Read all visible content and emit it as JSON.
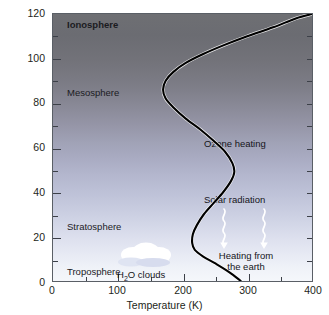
{
  "chart_data": {
    "type": "line",
    "title": "",
    "xlabel": "Temperature (K)",
    "ylabel": "Altitude (km)",
    "xlim": [
      0,
      400
    ],
    "ylim": [
      0,
      120
    ],
    "xticks": [
      0,
      100,
      200,
      300,
      400
    ],
    "yticks": [
      0,
      20,
      40,
      60,
      80,
      100,
      120
    ],
    "xtick_labels": [
      "0",
      "100",
      "200",
      "300",
      "400"
    ],
    "ytick_labels": [
      "0",
      "20",
      "40",
      "60",
      "80",
      "100",
      "120"
    ],
    "x_minor_step": 50,
    "y_minor_step": 10,
    "grid": false,
    "legend": false,
    "series": [
      {
        "name": "Atmospheric temperature profile",
        "color": "#000000",
        "x_is_temperature": true,
        "points": [
          {
            "temperature_K": 290,
            "altitude_km": 0
          },
          {
            "temperature_K": 272,
            "altitude_km": 4
          },
          {
            "temperature_K": 250,
            "altitude_km": 8
          },
          {
            "temperature_K": 232,
            "altitude_km": 11
          },
          {
            "temperature_K": 219,
            "altitude_km": 14
          },
          {
            "temperature_K": 215,
            "altitude_km": 17
          },
          {
            "temperature_K": 216,
            "altitude_km": 21
          },
          {
            "temperature_K": 222,
            "altitude_km": 25
          },
          {
            "temperature_K": 233,
            "altitude_km": 30
          },
          {
            "temperature_K": 248,
            "altitude_km": 35
          },
          {
            "temperature_K": 263,
            "altitude_km": 40
          },
          {
            "temperature_K": 275,
            "altitude_km": 45
          },
          {
            "temperature_K": 280,
            "altitude_km": 49
          },
          {
            "temperature_K": 277,
            "altitude_km": 53
          },
          {
            "temperature_K": 266,
            "altitude_km": 58
          },
          {
            "temperature_K": 248,
            "altitude_km": 63
          },
          {
            "temperature_K": 228,
            "altitude_km": 68
          },
          {
            "temperature_K": 205,
            "altitude_km": 73
          },
          {
            "temperature_K": 186,
            "altitude_km": 78
          },
          {
            "temperature_K": 174,
            "altitude_km": 82
          },
          {
            "temperature_K": 170,
            "altitude_km": 86
          },
          {
            "temperature_K": 174,
            "altitude_km": 90
          },
          {
            "temperature_K": 186,
            "altitude_km": 94
          },
          {
            "temperature_K": 205,
            "altitude_km": 98
          },
          {
            "temperature_K": 232,
            "altitude_km": 102
          },
          {
            "temperature_K": 264,
            "altitude_km": 106
          },
          {
            "temperature_K": 300,
            "altitude_km": 110
          },
          {
            "temperature_K": 340,
            "altitude_km": 114
          },
          {
            "temperature_K": 375,
            "altitude_km": 118
          },
          {
            "temperature_K": 400,
            "altitude_km": 120
          }
        ],
        "key_features": [
          {
            "name": "surface",
            "temperature_K": 290,
            "altitude_km": 0
          },
          {
            "name": "tropopause",
            "temperature_K": 215,
            "altitude_km": 16
          },
          {
            "name": "stratopause",
            "temperature_K": 280,
            "altitude_km": 49
          },
          {
            "name": "mesopause",
            "temperature_K": 170,
            "altitude_km": 86
          },
          {
            "name": "thermosphere-top",
            "temperature_K": 400,
            "altitude_km": 120
          }
        ]
      }
    ],
    "regions": [
      {
        "label": "Ionosphere",
        "altitude_km_center": 116,
        "bold": true
      },
      {
        "label": "Mesosphere",
        "altitude_km_center": 87,
        "bold": false
      },
      {
        "label": "Stratosphere",
        "altitude_km_center": 27,
        "bold": false
      },
      {
        "label": "Troposphere",
        "altitude_km_center": 7,
        "bold": false
      }
    ],
    "annotations": [
      {
        "label": "Ozone heating",
        "temperature_K": 320,
        "altitude_km": 62
      },
      {
        "label": "Solar radiation",
        "temperature_K": 330,
        "altitude_km": 38
      },
      {
        "label": "Heating from the earth",
        "lines": [
          "Heating from",
          "the earth"
        ],
        "temperature_K": 330,
        "altitude_km": 11
      },
      {
        "label": "H2O clouds",
        "display": "H₂O clouds",
        "temperature_K": 150,
        "altitude_km": 2
      }
    ]
  },
  "axes": {
    "y_title": "Altitude (km)",
    "x_title": "Temperature (K)",
    "y_labels": [
      "120",
      "100",
      "80",
      "60",
      "40",
      "20",
      "0"
    ],
    "x_labels": [
      "0",
      "100",
      "200",
      "300",
      "400"
    ]
  },
  "layers": {
    "ionosphere": "Ionosphere",
    "mesosphere": "Mesosphere",
    "stratosphere": "Stratosphere",
    "troposphere": "Troposphere"
  },
  "annotations": {
    "ozone_heating": "Ozone heating",
    "solar_radiation": "Solar radiation",
    "heating_line1": "Heating from",
    "heating_line2": "the earth",
    "clouds_h": "H",
    "clouds_sub": "2",
    "clouds_rest": "O clouds"
  },
  "colors": {
    "curve": "#000000",
    "frame": "#5a5f66",
    "text": "#231f20",
    "sky_top": "#6e6f73",
    "sky_mid": "#a9abc2",
    "sky_bottom": "#f5f7fb",
    "cloud": "#ffffff",
    "arrow": "#ffffff"
  }
}
